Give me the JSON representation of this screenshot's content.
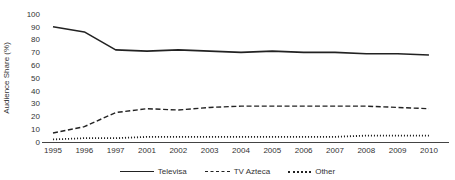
{
  "chart_data": {
    "type": "line",
    "title": "",
    "xlabel": "",
    "ylabel": "Audience Share (%)",
    "x": [
      "1995",
      "1996",
      "1997",
      "2001",
      "2002",
      "2003",
      "2004",
      "2005",
      "2006",
      "2007",
      "2008",
      "2009",
      "2010"
    ],
    "series": [
      {
        "name": "Televisa",
        "line_style": "solid",
        "values": [
          90,
          86,
          72,
          71,
          72,
          71,
          70,
          71,
          70,
          70,
          69,
          69,
          68
        ]
      },
      {
        "name": "TV Azteca",
        "line_style": "dashed",
        "values": [
          7,
          12,
          23,
          26,
          25,
          27,
          28,
          28,
          28,
          28,
          28,
          27,
          26
        ]
      },
      {
        "name": "Other",
        "line_style": "dotted",
        "values": [
          2,
          3,
          3,
          4,
          4,
          4,
          4,
          4,
          4,
          4,
          5,
          5,
          5
        ]
      }
    ],
    "ylim": [
      0,
      100
    ],
    "yticks": [
      0,
      10,
      20,
      30,
      40,
      50,
      60,
      70,
      80,
      90,
      100
    ],
    "grid": false,
    "legend_position": "bottom-center",
    "line_color": "#222222",
    "text_color": "#333333"
  }
}
